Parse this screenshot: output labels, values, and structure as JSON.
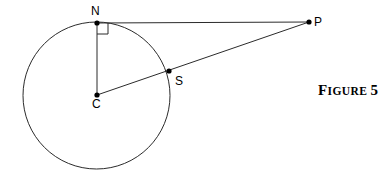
{
  "figure": {
    "caption_full": "FIGURE 5",
    "caption_lead": "F",
    "caption_small": "IGURE",
    "caption_space": " ",
    "caption_number": "5",
    "stroke_color": "#2b2b2b",
    "point_color": "#000000",
    "background_color": "#ffffff",
    "width": 391,
    "height": 179
  },
  "points": {
    "N": {
      "label": "N",
      "x": 97,
      "y": 23,
      "label_x": 91,
      "label_y": 5
    },
    "P": {
      "label": "P",
      "x": 309,
      "y": 22,
      "label_x": 314,
      "label_y": 16
    },
    "C": {
      "label": "C",
      "x": 97,
      "y": 95,
      "label_x": 92,
      "label_y": 98
    },
    "S": {
      "label": "S",
      "x": 169,
      "y": 71,
      "label_x": 175,
      "label_y": 75
    }
  },
  "circle": {
    "center_x": 96.5,
    "center_y": 95.5,
    "radius": 73.5
  },
  "segments": [
    {
      "name": "tangent-N-P",
      "from": "N",
      "to": "P",
      "x1": 97,
      "y1": 23,
      "x2": 309,
      "y2": 22
    },
    {
      "name": "radius-C-N",
      "from": "C",
      "to": "N",
      "x1": 97,
      "y1": 23,
      "x2": 97,
      "y2": 95
    },
    {
      "name": "secant-C-P",
      "from": "C",
      "to": "P",
      "x1": 97,
      "y1": 95,
      "x2": 309,
      "y2": 22
    }
  ],
  "right_angle": {
    "name": "right-angle-at-N",
    "vertex_x": 97,
    "vertex_y": 23,
    "size": 11,
    "path": "M 97,34 L 108,34 L 108,23"
  }
}
